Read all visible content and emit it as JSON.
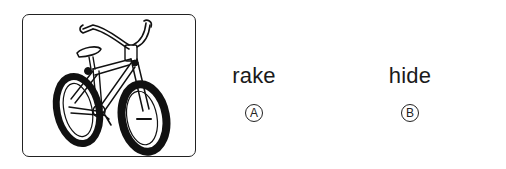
{
  "picture": {
    "subject": "bicycle",
    "icon": "bicycle-illustration"
  },
  "choices": [
    {
      "word": "rake",
      "letter": "A"
    },
    {
      "word": "hide",
      "letter": "B"
    }
  ],
  "colors": {
    "ink": "#1a1a1a",
    "background": "#ffffff"
  }
}
